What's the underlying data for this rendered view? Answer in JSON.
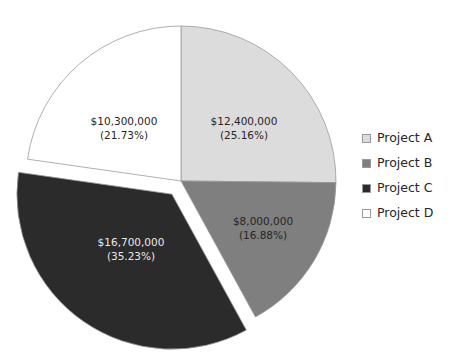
{
  "chart_data": {
    "type": "pie",
    "title": "",
    "subtitle": "",
    "xlabel": "",
    "ylabel": "",
    "grid": false,
    "legend_position": "right",
    "start_angle_deg": 0,
    "direction": "clockwise",
    "center": {
      "x": 181,
      "y": 181
    },
    "radius": 155,
    "total_value": 47400000,
    "categories": [
      "Project A",
      "Project B",
      "Project C",
      "Project D"
    ],
    "values": [
      12400000,
      8000000,
      16700000,
      10300000
    ],
    "percentages": [
      25.16,
      16.88,
      35.23,
      21.73
    ],
    "colors": [
      "#dcdcdc",
      "#7f7f7f",
      "#2b2b2b",
      "#ffffff"
    ],
    "slices": [
      {
        "name": "Project A",
        "value": 12400000,
        "percent": 25.16,
        "color": "#dcdcdc",
        "border_color": "#9a9a9a",
        "exploded": false,
        "label_value": "$12,400,000",
        "label_percent": "(25.16%)",
        "label_color": "#262626",
        "start_deg": 0.0,
        "end_deg": 90.6,
        "label_x": 244,
        "label_y": 122
      },
      {
        "name": "Project B",
        "value": 8000000,
        "percent": 16.88,
        "color": "#7f7f7f",
        "border_color": "#9a9a9a",
        "exploded": false,
        "label_value": "$8,000,000",
        "label_percent": "(16.88%)",
        "label_color": "#262626",
        "start_deg": 90.6,
        "end_deg": 151.3,
        "label_x": 263,
        "label_y": 222
      },
      {
        "name": "Project C",
        "value": 16700000,
        "percent": 35.23,
        "color": "#2b2b2b",
        "border_color": "#9a9a9a",
        "exploded": true,
        "explode_offset": 16,
        "label_value": "$16,700,000",
        "label_percent": "(35.23%)",
        "label_color": "#e8e8e8",
        "start_deg": 151.3,
        "end_deg": 278.1,
        "label_x": 131,
        "label_y": 243
      },
      {
        "name": "Project D",
        "value": 10300000,
        "percent": 21.73,
        "color": "#ffffff",
        "border_color": "#9a9a9a",
        "exploded": false,
        "label_value": "$10,300,000",
        "label_percent": "(21.73%)",
        "label_color": "#262626",
        "start_deg": 278.1,
        "end_deg": 360.0,
        "label_x": 124,
        "label_y": 122
      }
    ]
  },
  "legend": {
    "items": [
      {
        "label": "Project A",
        "color": "#dcdcdc"
      },
      {
        "label": "Project B",
        "color": "#7f7f7f"
      },
      {
        "label": "Project C",
        "color": "#2b2b2b"
      },
      {
        "label": "Project D",
        "color": "#ffffff"
      }
    ]
  }
}
